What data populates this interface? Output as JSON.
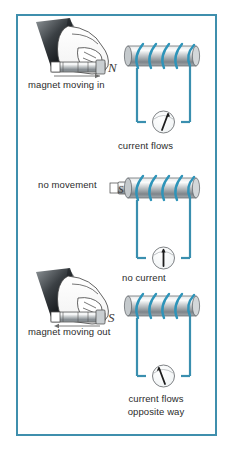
{
  "figure": {
    "border_color": "#3f8fad",
    "wire_color": "#3a8faf",
    "coil_color": "#2e94b9",
    "magnet_body_color": "#a9adb0",
    "background": "#ffffff",
    "text_color": "#2b2b2b"
  },
  "panels": [
    {
      "id": "panel-magnet-in",
      "magnet_label": "magnet moving in",
      "pole_letter": "N",
      "motion": "into-coil",
      "meter_label": "current flows",
      "meter_needle": "deflected-right",
      "has_hand": true
    },
    {
      "id": "panel-no-movement",
      "magnet_label": "no movement",
      "pole_letter": "S",
      "motion": "stationary",
      "meter_label": "no current",
      "meter_needle": "centered",
      "has_hand": false
    },
    {
      "id": "panel-magnet-out",
      "magnet_label": "magnet moving out",
      "pole_letter": "S",
      "motion": "out-of-coil",
      "meter_label_line1": "current flows",
      "meter_label_line2": "opposite way",
      "meter_needle": "deflected-left",
      "has_hand": true
    }
  ],
  "labels": {
    "magnet_moving_in": "magnet moving in",
    "current_flows": "current flows",
    "no_movement": "no movement",
    "no_current": "no current",
    "magnet_moving_out": "magnet moving out",
    "current_flows_2": "current flows",
    "opposite_way": "opposite way"
  }
}
